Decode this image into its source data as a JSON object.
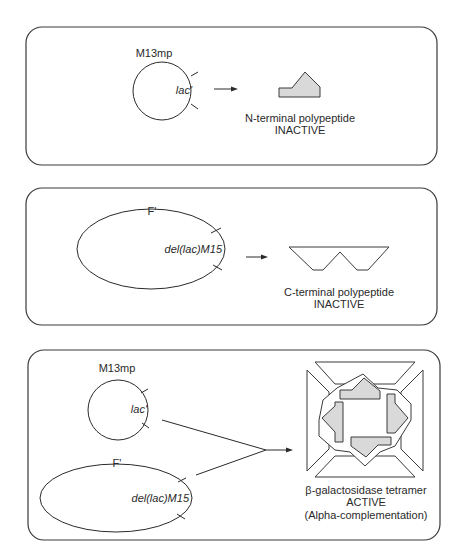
{
  "panels": [
    {
      "id": "panel-1",
      "plasmid": {
        "name": "M13mp",
        "gene": "lac'",
        "shape": "circle"
      },
      "product": {
        "line1": "N-terminal polypeptide",
        "line2": "INACTIVE",
        "shape": "n-terminal-fragment"
      }
    },
    {
      "id": "panel-2",
      "plasmid": {
        "name": "F'",
        "gene": "del(lac)M15",
        "shape": "ellipse"
      },
      "product": {
        "line1": "C-terminal polypeptide",
        "line2": "INACTIVE",
        "shape": "c-terminal-fragment"
      }
    },
    {
      "id": "panel-3",
      "plasmids": [
        {
          "name": "M13mp",
          "gene": "lac'",
          "shape": "circle"
        },
        {
          "name": "F'",
          "gene": "del(lac)M15",
          "shape": "ellipse"
        }
      ],
      "product": {
        "line1": "β-galactosidase tetramer",
        "line2": "ACTIVE",
        "line3": "(Alpha-complementation)",
        "shape": "tetramer"
      }
    }
  ],
  "colors": {
    "stroke": "#3a3a3a",
    "fill": "#d9d9d9",
    "background": "#ffffff"
  }
}
